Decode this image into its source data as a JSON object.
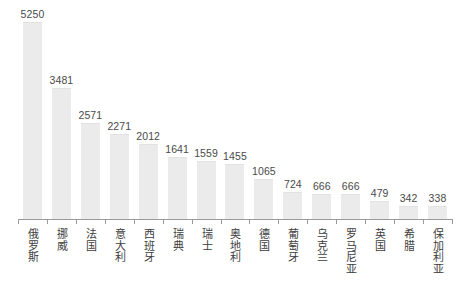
{
  "chart_data": {
    "type": "bar",
    "title": "",
    "subtitle": "",
    "xlabel": "",
    "ylabel": "",
    "ylim": [
      0,
      5250
    ],
    "grid": false,
    "legend": null,
    "orientation": "vertical",
    "bar_color": "#ebebeb",
    "axis_color": "#9a9a9a",
    "label_color": "#4a4a4a",
    "categories": [
      "俄罗斯",
      "挪威",
      "法国",
      "意大利",
      "西班牙",
      "瑞典",
      "瑞士",
      "奥地利",
      "德国",
      "葡萄牙",
      "乌克兰",
      "罗马尼亚",
      "英国",
      "希腊",
      "保加利亚"
    ],
    "values": [
      5250,
      3481,
      2571,
      2271,
      2012,
      1641,
      1559,
      1455,
      1065,
      724,
      666,
      666,
      479,
      342,
      338
    ],
    "value_labels": [
      "5250",
      "3481",
      "2571",
      "2271",
      "2012",
      "1641",
      "1559",
      "1455",
      "1065",
      "724",
      "666",
      "666",
      "479",
      "342",
      "338"
    ]
  }
}
